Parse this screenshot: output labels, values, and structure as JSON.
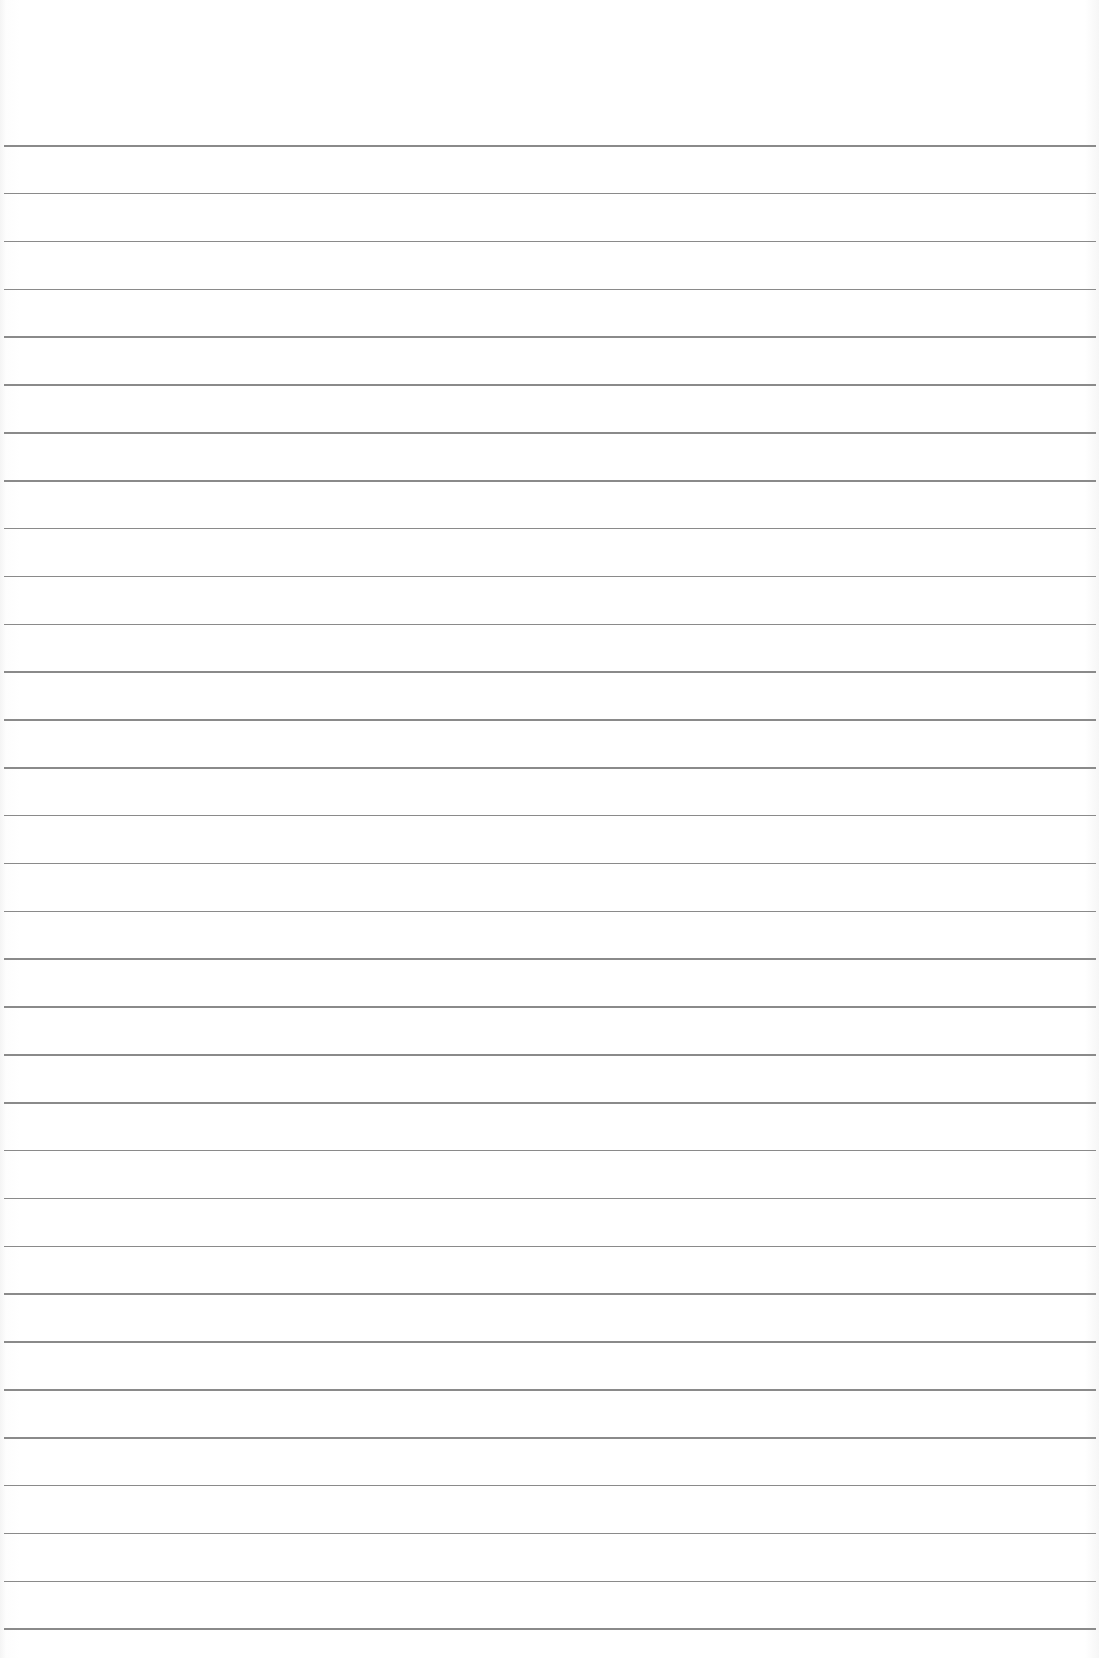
{
  "page": {
    "type": "lined-paper",
    "background_color": "#ffffff",
    "line_color": "#7d7d7d",
    "line_count": 32,
    "first_line_y": 145,
    "line_spacing": 47.85
  }
}
